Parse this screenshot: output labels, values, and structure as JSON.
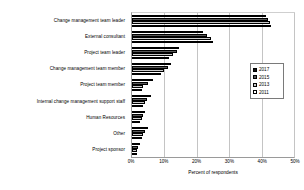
{
  "chart_data": {
    "type": "bar",
    "orientation": "horizontal",
    "title": "",
    "xlabel": "Percent of respondents",
    "ylabel": "",
    "xlim": [
      0,
      50
    ],
    "xticks": [
      "0%",
      "10%",
      "20%",
      "30%",
      "40%",
      "50%"
    ],
    "xtick_values": [
      0,
      10,
      20,
      30,
      40,
      50
    ],
    "grid": true,
    "legend_position": "right-middle",
    "categories": [
      "Change management team leader",
      "External consultant",
      "Project team leader",
      "Change management team member",
      "Project team member",
      "Internal change management support staff",
      "Human Resources",
      "Other",
      "Project sponsor"
    ],
    "series": [
      {
        "name": "2017",
        "color": "#111111",
        "values": [
          41.5,
          22.0,
          14.5,
          12.0,
          6.5,
          6.0,
          4.0,
          5.0,
          2.5
        ]
      },
      {
        "name": "2015",
        "color": "#585858",
        "values": [
          42.0,
          23.0,
          14.0,
          11.0,
          5.0,
          4.5,
          3.5,
          4.0,
          2.0
        ]
      },
      {
        "name": "2013",
        "color": "#c9c9c9",
        "values": [
          42.5,
          24.5,
          12.5,
          10.0,
          3.5,
          4.0,
          3.0,
          3.5,
          1.5
        ]
      },
      {
        "name": "2011",
        "color": "#ffffff",
        "values": [
          43.0,
          25.0,
          11.5,
          9.0,
          3.0,
          3.5,
          2.5,
          3.0,
          1.5
        ]
      }
    ]
  }
}
